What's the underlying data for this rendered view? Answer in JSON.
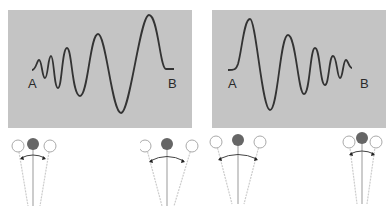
{
  "panels": [
    {
      "id": "wave-left",
      "label_start": "A",
      "label_end": "B",
      "description": "Wave with increasing amplitude and decreasing frequency from A to B"
    },
    {
      "id": "wave-right",
      "label_start": "A",
      "label_end": "B",
      "description": "Wave with decreasing amplitude and increasing frequency from A to B"
    }
  ],
  "pendulums": [
    {
      "id": "pendulum-1",
      "swing": "small",
      "length": "short"
    },
    {
      "id": "pendulum-2",
      "swing": "large",
      "length": "long"
    },
    {
      "id": "pendulum-3",
      "swing": "large",
      "length": "long"
    },
    {
      "id": "pendulum-4",
      "swing": "small",
      "length": "short"
    }
  ],
  "colors": {
    "panel_bg": "#c4c4c4",
    "wave": "#333333",
    "bob": "#5a5a5a",
    "string": "#bbbbbb"
  }
}
